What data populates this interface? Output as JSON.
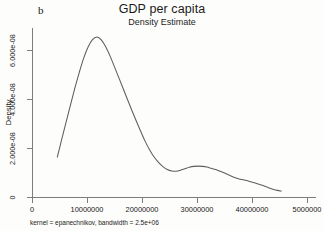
{
  "figure": {
    "panel_label": "b",
    "title": "GDP per capita",
    "subtitle": "Density Estimate",
    "footnote": "kernel = epanechnikov, bandwidth =  2.5e+06",
    "curve_color": "#5d5d5d",
    "axis_color": "#7d7d7d",
    "background_color": "#fdfdfb"
  },
  "chart_data": {
    "type": "line",
    "title": "GDP per capita",
    "subtitle": "Density Estimate",
    "panel_label": "b",
    "xlabel": "",
    "ylabel": "Density",
    "xlim": [
      0,
      50000000
    ],
    "ylim": [
      0,
      7e-08
    ],
    "grid": false,
    "legend": false,
    "annotation": "kernel = epanechnikov, bandwidth =  2.5e+06",
    "xticks": [
      0,
      10000000,
      20000000,
      30000000,
      40000000,
      50000000
    ],
    "xtick_labels": [
      "0",
      "10000000",
      "20000000",
      "30000000",
      "40000000",
      "5000000"
    ],
    "yticks": [
      0,
      2e-08,
      4e-08,
      6e-08
    ],
    "ytick_labels": [
      "0",
      "2.000e-08",
      "4.000e-08",
      "6.000e-08"
    ],
    "series": [
      {
        "name": "Density Estimate",
        "x": [
          4600000,
          5400000,
          6200000,
          7000000,
          7800000,
          8600000,
          9400000,
          10200000,
          11000000,
          11800000,
          12600000,
          13400000,
          14200000,
          15000000,
          15800000,
          16600000,
          17400000,
          18200000,
          19000000,
          19800000,
          20600000,
          21400000,
          22200000,
          23000000,
          23800000,
          24600000,
          25400000,
          26200000,
          27000000,
          27800000,
          28600000,
          29400000,
          30200000,
          31000000,
          31800000,
          32600000,
          33400000,
          34200000,
          35000000,
          35800000,
          36600000,
          37400000,
          38200000,
          39000000,
          39800000,
          40600000,
          41400000,
          42200000,
          43000000,
          43800000,
          44600000,
          45300000
        ],
        "y": [
          1.63e-08,
          2.35e-08,
          3.06e-08,
          3.76e-08,
          4.45e-08,
          5.09e-08,
          5.67e-08,
          6.12e-08,
          6.42e-08,
          6.53e-08,
          6.41e-08,
          6.13e-08,
          5.75e-08,
          5.31e-08,
          4.86e-08,
          4.41e-08,
          3.96e-08,
          3.51e-08,
          3.08e-08,
          2.66e-08,
          2.26e-08,
          1.92e-08,
          1.63e-08,
          1.41e-08,
          1.24e-08,
          1.12e-08,
          1.06e-08,
          1.05e-08,
          1.09e-08,
          1.15e-08,
          1.21e-08,
          1.25e-08,
          1.26e-08,
          1.25e-08,
          1.22e-08,
          1.17e-08,
          1.12e-08,
          1.05e-08,
          9.8e-09,
          9e-09,
          8.2e-09,
          7.6e-09,
          7.1e-09,
          6.7e-09,
          6.2e-09,
          5.7e-09,
          5.1e-09,
          4.5e-09,
          3.8e-09,
          3.2e-09,
          2.7e-09,
          2.4e-09
        ]
      }
    ],
    "peak": {
      "x": 11800000,
      "y": 6.53e-08
    },
    "secondary_peak": {
      "x": 30200000,
      "y": 1.26e-08
    }
  }
}
